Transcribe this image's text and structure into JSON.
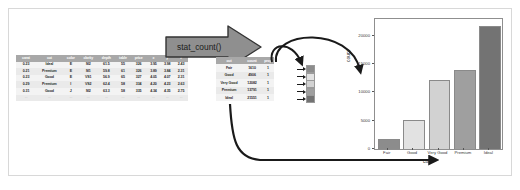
{
  "diagram": {
    "transform_label": "stat_count()",
    "arrow_icon": "block-arrow-right-icon"
  },
  "raw_table": {
    "columns": [
      "carat",
      "cut",
      "color",
      "clarity",
      "depth",
      "table",
      "price",
      "x",
      "y",
      "z"
    ],
    "rows": [
      [
        "0.23",
        "Ideal",
        "E",
        "SI2",
        "61.5",
        "55",
        "326",
        "3.95",
        "3.98",
        "2.43"
      ],
      [
        "0.21",
        "Premium",
        "E",
        "SI1",
        "59.8",
        "61",
        "326",
        "3.89",
        "3.84",
        "2.31"
      ],
      [
        "0.23",
        "Good",
        "E",
        "VS1",
        "56.9",
        "65",
        "327",
        "4.05",
        "4.07",
        "2.31"
      ],
      [
        "0.29",
        "Premium",
        "I",
        "VS2",
        "62.4",
        "58",
        "334",
        "4.20",
        "4.23",
        "2.63"
      ],
      [
        "0.31",
        "Good",
        "J",
        "SI2",
        "63.3",
        "58",
        "335",
        "4.34",
        "4.35",
        "2.75"
      ]
    ],
    "continuation_row": [
      "...",
      "...",
      "...",
      "...",
      "...",
      "...",
      "...",
      "...",
      "...",
      "..."
    ]
  },
  "summary_table": {
    "columns": [
      "cut",
      "count",
      "prop"
    ],
    "rows": [
      [
        "Fair",
        "1610",
        "1"
      ],
      [
        "Good",
        "4906",
        "1"
      ],
      [
        "Very Good",
        "12082",
        "1"
      ],
      [
        "Premium",
        "13791",
        "1"
      ],
      [
        "Ideal",
        "21551",
        "1"
      ]
    ]
  },
  "swatches": {
    "colors": [
      "#8c8c8c",
      "#e2e2e2",
      "#d2d2d2",
      "#9f9f9f",
      "#737373"
    ],
    "arrow_icon": "arrow-right-icon"
  },
  "chart_data": {
    "type": "bar",
    "title": "",
    "categories": [
      "Fair",
      "Good",
      "Very Good",
      "Premium",
      "Ideal"
    ],
    "values": [
      1610,
      4906,
      12082,
      13791,
      21551
    ],
    "bar_colors": [
      "#8c8c8c",
      "#e2e2e2",
      "#d2d2d2",
      "#9f9f9f",
      "#737373"
    ],
    "xlabel": "cut",
    "ylabel": "count",
    "yticks": [
      0,
      5000,
      10000,
      15000,
      20000
    ],
    "ytick_labels": [
      "0",
      "5000",
      "10000",
      "15000",
      "20000"
    ],
    "ylim": [
      0,
      23000
    ],
    "grid": false,
    "legend": "none"
  },
  "connectors": {
    "count_to_swatches": "curved-arrow-icon",
    "count_to_yaxis": "curved-arrow-icon",
    "cut_to_xaxis": "curved-arrow-icon"
  }
}
